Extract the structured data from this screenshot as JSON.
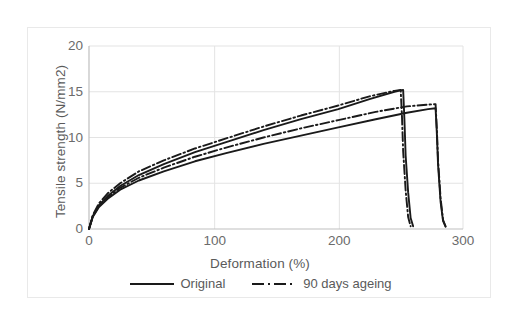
{
  "chart_data": {
    "type": "line",
    "title": "",
    "xlabel": "Deformation (%)",
    "ylabel": "Tensile strength (N/mm2)",
    "xlim": [
      0,
      300
    ],
    "ylim": [
      0,
      20
    ],
    "xticks": [
      "0",
      "100",
      "200",
      "300"
    ],
    "xtick_values": [
      0,
      100,
      200,
      300
    ],
    "yticks": [
      "0",
      "5",
      "10",
      "15",
      "20"
    ],
    "ytick_values": [
      0,
      5,
      10,
      15,
      20
    ],
    "grid": true,
    "legend_position": "bottom",
    "series": [
      {
        "name": "Original",
        "style": "solid",
        "color": "#1a1a1a",
        "x": [
          0,
          3,
          8,
          15,
          25,
          40,
          60,
          85,
          110,
          140,
          170,
          200,
          225,
          245,
          252,
          253,
          254,
          256,
          258,
          260
        ],
        "y": [
          0,
          1.4,
          2.6,
          3.6,
          4.7,
          5.9,
          7.1,
          8.4,
          9.5,
          10.8,
          12.0,
          13.1,
          14.2,
          15.0,
          15.2,
          12.0,
          8.0,
          4.0,
          1.2,
          0.3
        ]
      },
      {
        "name": "Original",
        "style": "solid",
        "color": "#1a1a1a",
        "x": [
          0,
          3,
          8,
          15,
          25,
          40,
          60,
          85,
          110,
          140,
          170,
          200,
          230,
          255,
          272,
          278,
          279,
          280,
          282,
          284,
          286
        ],
        "y": [
          0,
          1.3,
          2.4,
          3.3,
          4.3,
          5.3,
          6.3,
          7.4,
          8.3,
          9.3,
          10.2,
          11.1,
          12.0,
          12.7,
          13.1,
          13.2,
          10.5,
          7.0,
          3.0,
          0.9,
          0.25
        ]
      },
      {
        "name": "90 days ageing",
        "style": "dash-dot",
        "color": "#1a1a1a",
        "x": [
          0,
          3,
          8,
          15,
          25,
          40,
          60,
          85,
          110,
          140,
          170,
          200,
          225,
          245,
          250,
          251,
          252,
          254,
          256,
          258
        ],
        "y": [
          0,
          1.5,
          2.8,
          3.9,
          5.0,
          6.3,
          7.5,
          8.8,
          9.9,
          11.2,
          12.4,
          13.5,
          14.5,
          15.1,
          15.2,
          12.5,
          8.5,
          4.2,
          1.3,
          0.3
        ]
      },
      {
        "name": "90 days ageing",
        "style": "dash-dot",
        "color": "#1a1a1a",
        "x": [
          0,
          3,
          8,
          15,
          25,
          40,
          60,
          85,
          110,
          140,
          170,
          200,
          230,
          255,
          272,
          278,
          279,
          280,
          282,
          284,
          286
        ],
        "y": [
          0,
          1.35,
          2.5,
          3.45,
          4.5,
          5.6,
          6.7,
          7.9,
          8.9,
          10.0,
          11.0,
          11.9,
          12.8,
          13.4,
          13.6,
          13.65,
          11.0,
          7.5,
          3.4,
          1.0,
          0.3
        ]
      }
    ],
    "legend": [
      {
        "label": "Original",
        "style": "solid"
      },
      {
        "label": "90 days ageing",
        "style": "dash-dot"
      }
    ],
    "colors": {
      "line": "#1a1a1a",
      "grid": "#e3e3e3",
      "axis": "#bfbfbf",
      "text": "#5a5a5a",
      "frame": "#e9e9e9",
      "background": "#ffffff"
    }
  }
}
